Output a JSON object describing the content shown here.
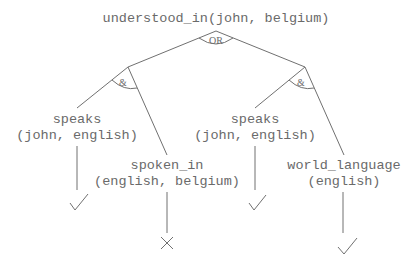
{
  "diagram": {
    "type": "and-or-tree",
    "root": {
      "label": "understood_in(john, belgium)",
      "connective": "OR"
    },
    "branches": [
      {
        "connective": "&",
        "children": [
          {
            "line1": "speaks",
            "line2": "(john, english)",
            "result": "check"
          },
          {
            "line1": "spoken_in",
            "line2": "(english, belgium)",
            "result": "cross"
          }
        ]
      },
      {
        "connective": "&",
        "children": [
          {
            "line1": "speaks",
            "line2": "(john, english)",
            "result": "check"
          },
          {
            "line1": "world_language",
            "line2": "(english)",
            "result": "check"
          }
        ]
      }
    ]
  }
}
